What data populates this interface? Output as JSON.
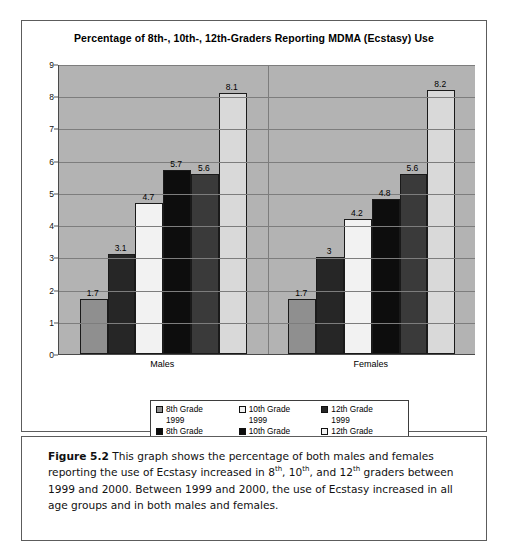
{
  "chart_data": {
    "type": "bar",
    "title": "Percentage of 8th-, 10th-, 12th-Graders Reporting MDMA (Ecstasy) Use",
    "xlabel": "",
    "ylabel": "",
    "ylim": [
      0,
      9
    ],
    "yticks": [
      0,
      1,
      2,
      3,
      4,
      5,
      6,
      7,
      8,
      9
    ],
    "grid": true,
    "legend_position": "bottom",
    "categories": [
      "Males",
      "Females"
    ],
    "series": [
      {
        "name": "8th Grade 1999",
        "values": [
          1.7,
          1.7
        ],
        "labels": [
          "1.7",
          "1.7"
        ],
        "color": "#8f8f8f"
      },
      {
        "name": "10th Grade 1999",
        "values": [
          3.1,
          3.0
        ],
        "labels": [
          "3.1",
          "3"
        ],
        "color": "#262626"
      },
      {
        "name": "12th Grade 1999",
        "values": [
          4.7,
          4.2
        ],
        "labels": [
          "4.7",
          "4.2"
        ],
        "color": "#f2f2f2"
      },
      {
        "name": "8th Grade 2000",
        "values": [
          5.7,
          4.8
        ],
        "labels": [
          "5.7",
          "4.8"
        ],
        "color": "#0d0d0d"
      },
      {
        "name": "10th Grade 2000",
        "values": [
          5.6,
          5.6
        ],
        "labels": [
          "5.6",
          "5.6"
        ],
        "color": "#3a3a3a"
      },
      {
        "name": "12th Grade 2000",
        "values": [
          8.1,
          8.2
        ],
        "labels": [
          "8.1",
          "8.2"
        ],
        "color": "#d9d9d9"
      }
    ],
    "plot_background": "#b3b3b3"
  },
  "legend": {
    "items": [
      {
        "label_line1": "8th Grade",
        "label_line2": "1999",
        "color": "#8f8f8f"
      },
      {
        "label_line1": "10th Grade",
        "label_line2": "1999",
        "color": "#f2f2f2"
      },
      {
        "label_line1": "12th Grade",
        "label_line2": "1999",
        "color": "#262626"
      },
      {
        "label_line1": "8th Grade",
        "label_line2": "2000",
        "color": "#0d0d0d"
      },
      {
        "label_line1": "10th Grade",
        "label_line2": "2000",
        "color": "#0d0d0d"
      },
      {
        "label_line1": "12th Grade",
        "label_line2": "2000",
        "color": "#f2f2f2"
      }
    ]
  },
  "caption": {
    "figure_label": "Figure 5.2",
    "text_part1": "  This graph shows the percentage of both males and females reporting the use of Ecstasy increased in 8",
    "sup1": "th",
    "text_part2": ", 10",
    "sup2": "th",
    "text_part3": ", and 12",
    "sup3": "th",
    "text_part4": " graders between 1999 and 2000. Between 1999 and 2000, the use of Ecstasy increased in all age groups and in both males and females."
  }
}
